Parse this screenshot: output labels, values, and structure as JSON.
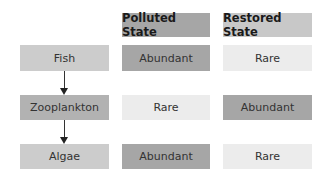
{
  "headers": {
    "polluted": "Polluted State",
    "restored": "Restored State"
  },
  "rows": [
    {
      "organism": "Fish",
      "polluted": "Abundant",
      "restored": "Rare"
    },
    {
      "organism": "Zooplankton",
      "polluted": "Rare",
      "restored": "Abundant"
    },
    {
      "organism": "Algae",
      "polluted": "Abundant",
      "restored": "Rare"
    }
  ],
  "colors": {
    "header_polluted": "#a6a6a6",
    "header_restored": "#c8c8c8",
    "abundant": "#a6a6a6",
    "rare": "#ececec",
    "fish_box": "#cccccc",
    "zooplankton_box": "#b2b2b2",
    "algae_box": "#cccccc"
  },
  "food_chain_arrows": [
    {
      "from": "Fish",
      "to": "Zooplankton"
    },
    {
      "from": "Zooplankton",
      "to": "Algae"
    }
  ]
}
